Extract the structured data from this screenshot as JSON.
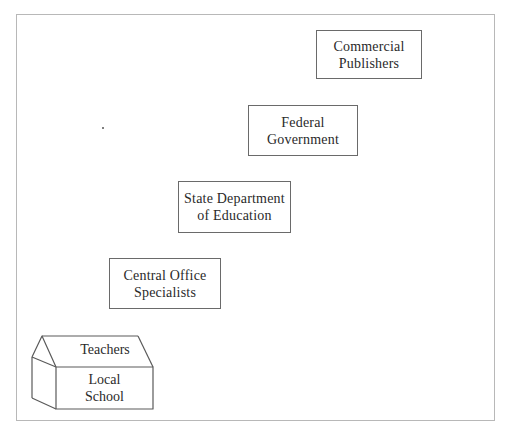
{
  "diagram": {
    "type": "staircase-hierarchy",
    "levels": [
      {
        "id": "commercial-publishers",
        "lines": [
          "Commercial",
          "Publishers"
        ]
      },
      {
        "id": "federal-government",
        "lines": [
          "Federal",
          "Government"
        ]
      },
      {
        "id": "state-department",
        "lines": [
          "State Department",
          "of Education"
        ]
      },
      {
        "id": "central-office",
        "lines": [
          "Central Office",
          "Specialists"
        ]
      }
    ],
    "school": {
      "roof_label": "Teachers",
      "front_lines": [
        "Local",
        "School"
      ]
    },
    "colors": {
      "border": "#6a6a6a",
      "frame": "#b8b8b8",
      "text": "#2a2a2a",
      "background": "#ffffff"
    }
  }
}
